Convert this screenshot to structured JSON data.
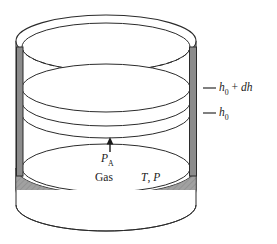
{
  "figure": {
    "background_color": "#ffffff",
    "line_color": "#2b2b2b",
    "wall_fill_color": "#8c8c8c",
    "base_fill_color": "#808080",
    "base_hatch_color": "#a9a9a9"
  },
  "labels": {
    "height_upper": {
      "symbol": "h",
      "subscript": "0",
      "suffix": " + ",
      "increment": "dh",
      "text": "h0 + dh"
    },
    "height_lower": {
      "symbol": "h",
      "subscript": "0",
      "text": "h0"
    },
    "pressure_applied": {
      "symbol": "P",
      "subscript": "A",
      "text": "PA"
    },
    "gas": "Gas",
    "state": "T, P"
  },
  "annotations": {
    "leader_upper": "tick-dash-upper",
    "leader_lower": "tick-dash-lower",
    "arrow_pa": "up-arrow"
  }
}
